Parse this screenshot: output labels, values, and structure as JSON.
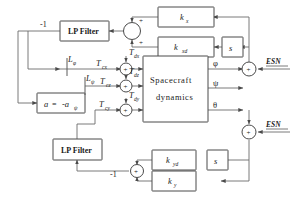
{
  "diagram": {
    "blocks": {
      "lp_filter_top": "LP Filter",
      "lp_filter_bottom": "LP Filter",
      "alpha": "a",
      "alpha_eq": "=",
      "alpha_neg": "-a",
      "alpha_sub": "ψ",
      "k_x": "k",
      "k_x_sub": "x",
      "k_xd": "k",
      "k_xd_sub": "xd",
      "s_top": "s",
      "s_bottom": "s",
      "k_yd": "k",
      "k_yd_sub": "yd",
      "k_y": "k",
      "k_y_sub": "y",
      "spacecraft_line1": "Spacecraft",
      "spacecraft_line2": "dynamics"
    },
    "signals": {
      "gain_minus_one_top": "-1",
      "gain_minus_one_bottom": "-1",
      "esn_top": "ESN",
      "esn_bottom": "ESN",
      "torque_cx": "T",
      "torque_cx_sub": "cx",
      "torque_cz": "T",
      "torque_cz_sub": "cz",
      "torque_cy": "T",
      "torque_cy_sub": "cy",
      "dist_dx": "T",
      "dist_dx_sub": "dx",
      "dist_dz": "T",
      "dist_dz_sub": "dz",
      "dist_dy": "T",
      "dist_dy_sub": "dy",
      "limiter_phi": "L",
      "limiter_phi_sub": "φ",
      "limiter_psi": "L",
      "limiter_psi_sub": "ψ",
      "out_phi": "φ",
      "out_psi": "ψ",
      "out_theta": "θ"
    },
    "sum_signs": {
      "top_upper": "+",
      "top_lower": "+",
      "junction_dx": "+",
      "junction_dz": "+",
      "junction_dy": "+",
      "esn_top_sign": "+",
      "esn_bottom_sign": "+",
      "bottom_sum": "+"
    },
    "colors": {
      "stroke": "#4a4a4a",
      "wire": "#6b6b6b",
      "background": "#ffffff",
      "text": "#1a1a1a"
    }
  }
}
